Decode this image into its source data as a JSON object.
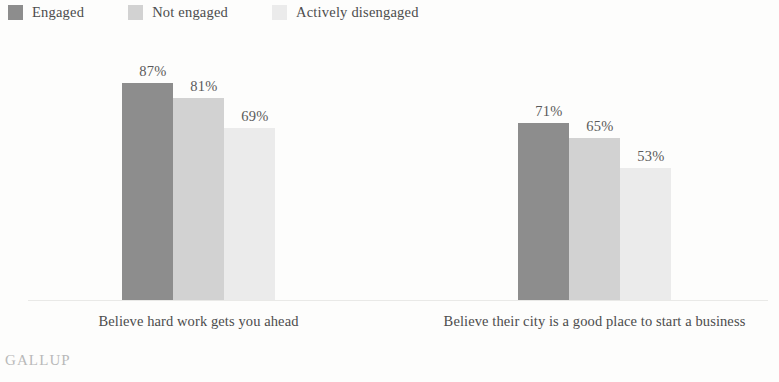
{
  "legend": {
    "items": [
      {
        "label": "Engaged",
        "color": "#8d8d8d"
      },
      {
        "label": "Not engaged",
        "color": "#d2d2d2"
      },
      {
        "label": "Actively disengaged",
        "color": "#ebebeb"
      }
    ]
  },
  "brand": "GALLUP",
  "chart_data": {
    "type": "bar",
    "title": "",
    "xlabel": "",
    "ylabel": "",
    "ylim": [
      0,
      100
    ],
    "grid": false,
    "legend_position": "top-left",
    "value_suffix": "%",
    "categories": [
      "Believe hard work gets you ahead",
      "Believe their city is a good place to start a business"
    ],
    "series": [
      {
        "name": "Engaged",
        "color": "#8d8d8d",
        "values": [
          87,
          71
        ],
        "labels": [
          "87%",
          "71%"
        ]
      },
      {
        "name": "Not engaged",
        "color": "#d2d2d2",
        "values": [
          81,
          65
        ],
        "labels": [
          "81%",
          "65%"
        ]
      },
      {
        "name": "Actively disengaged",
        "color": "#ebebeb",
        "values": [
          69,
          53
        ],
        "labels": [
          "69%",
          "53%"
        ]
      }
    ]
  }
}
